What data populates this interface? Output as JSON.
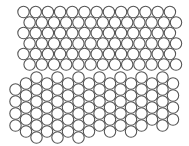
{
  "figure": {
    "width": 189,
    "height": 146,
    "background": "#ffffff",
    "stroke_color": "#555555",
    "fill_color": "#ffffff",
    "radius": 5.7
  },
  "upper_lattice": {
    "orientation": "rows",
    "rows": 6,
    "cols": 13,
    "origin_x": 23.5,
    "origin_y": 12,
    "pitch_x": 12.2,
    "pitch_y": 10.5,
    "odd_row_offset_x": 6.1
  },
  "lower_lattice": {
    "orientation": "columns",
    "columns": [
      {
        "x": 15.5,
        "y_start": 89.5,
        "count": 4
      },
      {
        "x": 26,
        "y_start": 83.5,
        "count": 5
      },
      {
        "x": 36.5,
        "y_start": 77.5,
        "count": 6
      },
      {
        "x": 47,
        "y_start": 83.5,
        "count": 5
      },
      {
        "x": 57.5,
        "y_start": 77.5,
        "count": 6
      },
      {
        "x": 68,
        "y_start": 83.5,
        "count": 5
      },
      {
        "x": 78.5,
        "y_start": 77.5,
        "count": 6
      },
      {
        "x": 89,
        "y_start": 83.5,
        "count": 5
      },
      {
        "x": 99.5,
        "y_start": 77.5,
        "count": 5
      },
      {
        "x": 110,
        "y_start": 83.5,
        "count": 5
      },
      {
        "x": 120.5,
        "y_start": 77.5,
        "count": 5
      },
      {
        "x": 131,
        "y_start": 83.5,
        "count": 5
      },
      {
        "x": 141.5,
        "y_start": 77.5,
        "count": 5
      },
      {
        "x": 152,
        "y_start": 83.5,
        "count": 4
      },
      {
        "x": 162.5,
        "y_start": 77.5,
        "count": 5
      },
      {
        "x": 173,
        "y_start": 83.5,
        "count": 4
      }
    ],
    "pitch_y": 12
  }
}
